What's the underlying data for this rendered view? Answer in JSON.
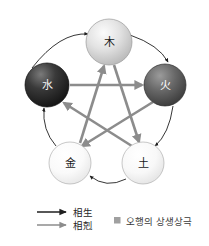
{
  "figure": {
    "title": "오행의 상생상극",
    "background_color": "#ffffff",
    "width": 209,
    "height": 246
  },
  "nodes": [
    {
      "id": "wood",
      "label": "木",
      "position": "top",
      "cx": 109,
      "cy": 42,
      "r": 23,
      "fill_light": "#f2f2f2",
      "fill_dark": "#b8b8b8",
      "stroke": "#9a9a9a",
      "text_color": "#1a1a1a"
    },
    {
      "id": "fire",
      "label": "火",
      "position": "right",
      "cx": 165,
      "cy": 85,
      "r": 21,
      "fill_light": "#8f8f8f",
      "fill_dark": "#3d3d3d",
      "stroke": "#2e2e2e",
      "text_color": "#ffffff"
    },
    {
      "id": "water",
      "label": "水",
      "position": "left",
      "cx": 47,
      "cy": 85,
      "r": 22,
      "fill_light": "#6a6a6a",
      "fill_dark": "#141414",
      "stroke": "#0d0d0d",
      "text_color": "#f5f5f5"
    },
    {
      "id": "metal",
      "label": "金",
      "position": "bottom-left",
      "cx": 70,
      "cy": 163,
      "r": 21,
      "fill_light": "#ffffff",
      "fill_dark": "#e6e6e6",
      "stroke": "#b0b0b0",
      "text_color": "#1a1a1a"
    },
    {
      "id": "earth",
      "label": "土",
      "position": "bottom-right",
      "cx": 143,
      "cy": 163,
      "r": 21,
      "fill_light": "#ffffff",
      "fill_dark": "#e2e2e2",
      "stroke": "#b0b0b0",
      "text_color": "#1a1a1a"
    }
  ],
  "cycles": {
    "generation": {
      "name": "相生",
      "color": "#1f1f1f",
      "stroke_width": 1,
      "style": "thin-curved-arc",
      "edges": [
        {
          "from": "water",
          "to": "wood"
        },
        {
          "from": "wood",
          "to": "fire"
        },
        {
          "from": "fire",
          "to": "earth"
        },
        {
          "from": "earth",
          "to": "metal"
        },
        {
          "from": "metal",
          "to": "water"
        }
      ]
    },
    "overcoming": {
      "name": "相剋",
      "color": "#8c8c8c",
      "stroke_width": 3,
      "style": "thick-straight-pentagram",
      "edges": [
        {
          "from": "water",
          "to": "fire"
        },
        {
          "from": "fire",
          "to": "metal"
        },
        {
          "from": "metal",
          "to": "wood"
        },
        {
          "from": "wood",
          "to": "earth"
        },
        {
          "from": "earth",
          "to": "water"
        }
      ]
    }
  },
  "legend": {
    "items": [
      {
        "id": "generation",
        "label": "相生",
        "arrow_color": "#1f1f1f",
        "arrow_width": 1.6
      },
      {
        "id": "overcoming",
        "label": "相剋",
        "arrow_color": "#8c8c8c",
        "arrow_width": 1.6
      }
    ],
    "caption": {
      "bullet_color": "#a0a0a0",
      "text": "오행의 상생상극"
    }
  }
}
